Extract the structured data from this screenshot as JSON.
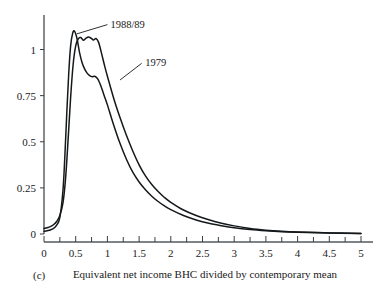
{
  "chart_data": {
    "type": "line",
    "title": "",
    "subtitle": "",
    "xlabel": "Equivalent net income BHC divided by contemporary mean",
    "ylabel": "",
    "panel_label": "(c)",
    "xlim": [
      0,
      5
    ],
    "ylim": [
      0,
      1.16
    ],
    "grid": false,
    "legend_position": "inline-annotations",
    "x_tick_labels": [
      "0",
      "0.5",
      "1",
      "1.5",
      "2",
      "2.5",
      "3",
      "3.5",
      "4",
      "4.5",
      "5"
    ],
    "x_tick_values": [
      0,
      0.5,
      1,
      1.5,
      2,
      2.5,
      3,
      3.5,
      4,
      4.5,
      5
    ],
    "x_minor_tick_values": [
      0.25,
      0.75,
      1.25,
      1.75,
      2.25,
      2.75,
      3.25,
      3.75,
      4.25,
      4.75
    ],
    "y_tick_labels": [
      "0",
      "0.25",
      "0.5",
      "0.75",
      "1"
    ],
    "y_tick_values": [
      0,
      0.25,
      0.5,
      0.75,
      1
    ],
    "annotations": [
      {
        "text": "1988/89",
        "x": 1.0,
        "y": 1.14
      },
      {
        "text": "1979",
        "x": 1.55,
        "y": 0.93
      }
    ],
    "series": [
      {
        "name": "1979",
        "label": "1979",
        "color": "#15181a",
        "x": [
          0.0,
          0.05,
          0.1,
          0.15,
          0.2,
          0.25,
          0.3,
          0.33,
          0.36,
          0.39,
          0.42,
          0.45,
          0.48,
          0.52,
          0.56,
          0.6,
          0.64,
          0.68,
          0.72,
          0.76,
          0.8,
          0.85,
          0.9,
          0.95,
          1.0,
          1.1,
          1.2,
          1.3,
          1.4,
          1.5,
          1.6,
          1.7,
          1.8,
          1.9,
          2.0,
          2.2,
          2.4,
          2.6,
          2.8,
          3.0,
          3.25,
          3.5,
          3.75,
          4.0,
          4.5,
          5.0
        ],
        "y": [
          0.015,
          0.018,
          0.022,
          0.03,
          0.048,
          0.09,
          0.24,
          0.43,
          0.66,
          0.87,
          1.02,
          1.085,
          1.1,
          1.06,
          0.985,
          0.93,
          0.895,
          0.872,
          0.858,
          0.852,
          0.855,
          0.84,
          0.8,
          0.75,
          0.7,
          0.59,
          0.49,
          0.405,
          0.335,
          0.282,
          0.24,
          0.205,
          0.176,
          0.152,
          0.132,
          0.1,
          0.076,
          0.058,
          0.045,
          0.034,
          0.024,
          0.017,
          0.012,
          0.009,
          0.005,
          0.003
        ]
      },
      {
        "name": "1988/89",
        "label": "1988/89",
        "color": "#15181a",
        "x": [
          0.0,
          0.05,
          0.1,
          0.15,
          0.2,
          0.25,
          0.3,
          0.34,
          0.38,
          0.42,
          0.46,
          0.5,
          0.54,
          0.58,
          0.62,
          0.66,
          0.7,
          0.74,
          0.78,
          0.82,
          0.86,
          0.9,
          0.95,
          1.0,
          1.1,
          1.2,
          1.3,
          1.4,
          1.5,
          1.6,
          1.7,
          1.8,
          1.9,
          2.0,
          2.2,
          2.4,
          2.6,
          2.8,
          3.0,
          3.25,
          3.5,
          3.75,
          4.0,
          4.5,
          5.0
        ],
        "y": [
          0.03,
          0.034,
          0.04,
          0.05,
          0.068,
          0.1,
          0.17,
          0.3,
          0.51,
          0.74,
          0.92,
          1.02,
          1.058,
          1.065,
          1.05,
          1.06,
          1.068,
          1.062,
          1.052,
          1.06,
          1.04,
          0.99,
          0.92,
          0.855,
          0.735,
          0.63,
          0.535,
          0.45,
          0.375,
          0.315,
          0.268,
          0.23,
          0.198,
          0.172,
          0.13,
          0.1,
          0.077,
          0.058,
          0.044,
          0.03,
          0.021,
          0.015,
          0.011,
          0.006,
          0.003
        ]
      }
    ]
  }
}
